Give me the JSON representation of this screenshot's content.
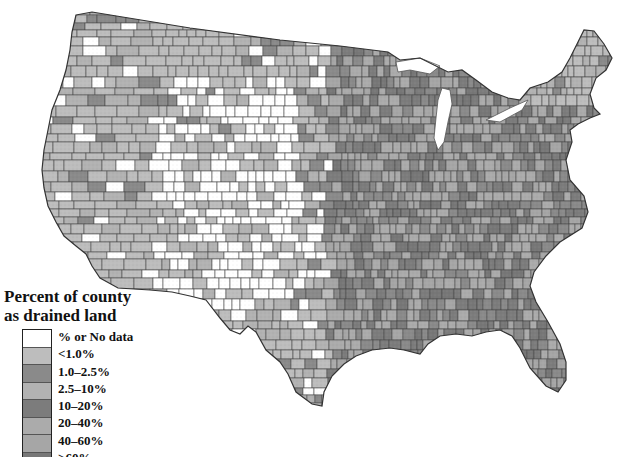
{
  "legend": {
    "title_line1": "Percent of county",
    "title_line2": "as drained land",
    "items": [
      {
        "label": "% or No data",
        "color": "#ffffff"
      },
      {
        "label": "<1.0%",
        "color": "#bdbdbd"
      },
      {
        "label": "1.0–2.5%",
        "color": "#8a8a8a"
      },
      {
        "label": "2.5–10%",
        "color": "#b2b2b2"
      },
      {
        "label": "10–20%",
        "color": "#7c7c7c"
      },
      {
        "label": "20–40%",
        "color": "#ababab"
      },
      {
        "label": "40–60%",
        "color": "#a6a6a6"
      },
      {
        "label": ">60%",
        "color": "#777777"
      }
    ]
  },
  "map": {
    "subject": "Contiguous United States counties",
    "border_color": "#444444",
    "background": "#ffffff"
  }
}
